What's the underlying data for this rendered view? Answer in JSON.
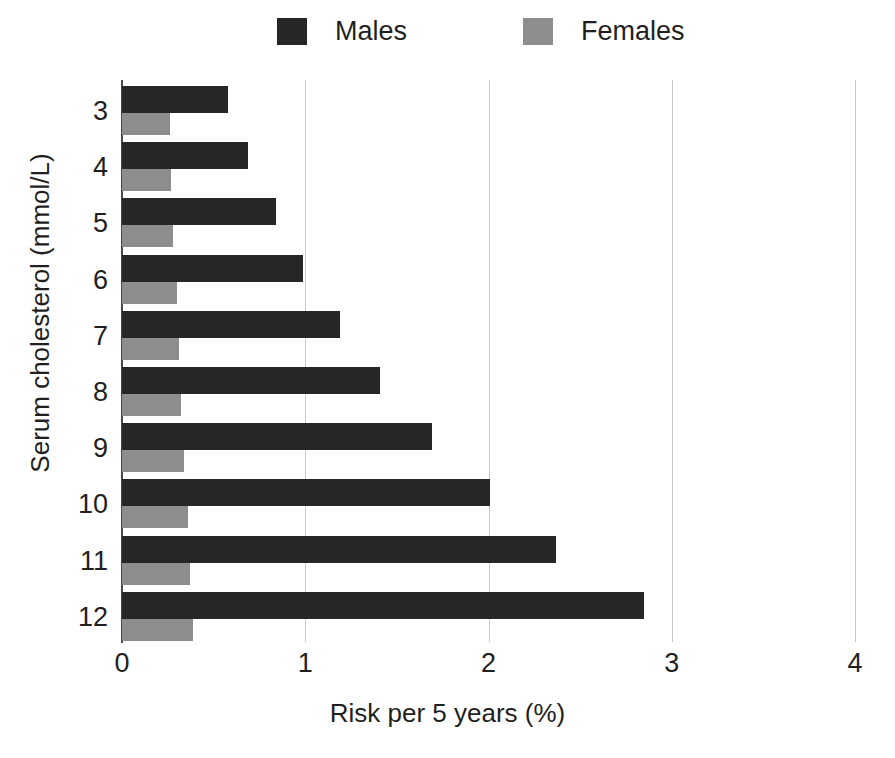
{
  "chart_data": {
    "type": "bar",
    "orientation": "horizontal",
    "title": "",
    "xlabel": "Risk per 5 years (%)",
    "ylabel": "Serum cholesterol (mmol/L)",
    "categories": [
      "3",
      "4",
      "5",
      "6",
      "7",
      "8",
      "9",
      "10",
      "11",
      "12"
    ],
    "xlim": [
      0,
      4
    ],
    "xticks": [
      "0",
      "1",
      "2",
      "3",
      "4"
    ],
    "xtick_values": [
      0,
      1,
      2,
      3,
      4
    ],
    "grid": "vertical",
    "legend_position": "top",
    "series": [
      {
        "name": "Males",
        "color": "#262626",
        "values": [
          0.58,
          0.69,
          0.84,
          0.99,
          1.19,
          1.41,
          1.69,
          2.01,
          2.37,
          2.85
        ]
      },
      {
        "name": "Females",
        "color": "#8d8d8d",
        "values": [
          0.26,
          0.27,
          0.28,
          0.3,
          0.31,
          0.32,
          0.34,
          0.36,
          0.37,
          0.39
        ]
      }
    ]
  },
  "legend": {
    "males_label": "Males",
    "females_label": "Females"
  },
  "axes": {
    "x_title": "Risk per 5 years (%)",
    "y_title": "Serum cholesterol (mmol/L)"
  }
}
